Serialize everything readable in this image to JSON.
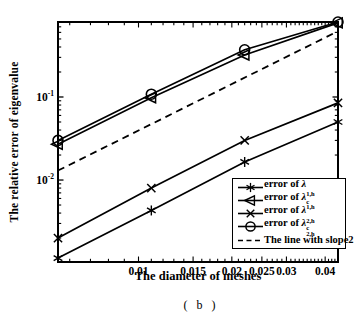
{
  "figure": {
    "caption": "( b )"
  },
  "colors": {
    "stroke": "#000000",
    "background": "#ffffff"
  },
  "chart_data": {
    "type": "line",
    "title": "",
    "xlabel": "The diameter of meshes",
    "ylabel": "The relative error of eigenvalue",
    "x_scale": "log",
    "y_scale": "log",
    "xlim": [
      0.0055,
      0.044
    ],
    "ylim": [
      0.00103,
      0.8
    ],
    "grid": false,
    "legend_position": "lower right",
    "x_ticks": [
      {
        "value": 0.01,
        "label": "0.01"
      },
      {
        "value": 0.015,
        "label": "0.015"
      },
      {
        "value": 0.02,
        "label": "0.02"
      },
      {
        "value": 0.025,
        "label": "0.025"
      },
      {
        "value": 0.03,
        "label": "0.03"
      },
      {
        "value": 0.04,
        "label": "0.04"
      }
    ],
    "y_ticks": [
      {
        "value": 0.1,
        "base": "10",
        "exp": "-1"
      },
      {
        "value": 0.01,
        "base": "10",
        "exp": "-2"
      }
    ],
    "x": [
      0.0055,
      0.011,
      0.022,
      0.044
    ],
    "series": [
      {
        "name": "error of lambda_1,h",
        "marker": "asterisk",
        "line": "solid",
        "values": [
          0.00115,
          0.0043,
          0.0165,
          0.05
        ],
        "legend": {
          "pre": "error of ",
          "sym": "λ",
          "sup": "",
          "sub": "1,h"
        }
      },
      {
        "name": "error of lambda_c_1,h",
        "marker": "triangle-left",
        "line": "solid",
        "values": [
          0.027,
          0.098,
          0.32,
          0.78
        ],
        "legend": {
          "pre": "error of ",
          "sym": "λ",
          "sup": "c",
          "sub": "1,h"
        }
      },
      {
        "name": "error of lambda_2,h",
        "marker": "x",
        "line": "solid",
        "values": [
          0.002,
          0.008,
          0.03,
          0.085
        ],
        "legend": {
          "pre": "error of ",
          "sym": "λ",
          "sup": "",
          "sub": "2,h"
        }
      },
      {
        "name": "error of lambda_c_2,h",
        "marker": "circle",
        "line": "solid",
        "values": [
          0.03,
          0.108,
          0.37,
          0.8
        ],
        "legend": {
          "pre": "error of ",
          "sym": "λ",
          "sup": "c",
          "sub": "2,h"
        }
      }
    ],
    "reference_line": {
      "label": "The line with slope2",
      "style": "dashed",
      "slope": 2,
      "x": [
        0.0055,
        0.044
      ],
      "y": [
        0.013,
        0.62
      ]
    }
  }
}
